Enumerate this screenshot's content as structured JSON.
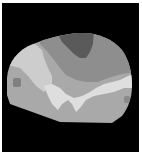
{
  "image": {
    "description": "Grayscale segmented region map of a rounded head/brain-like shape on a black square background",
    "background_color": "#000000",
    "margin_color": "#ffffff",
    "regions": [
      {
        "name": "outer-base",
        "color": "#a9a9a9"
      },
      {
        "name": "upper-band",
        "color": "#8e8e8e"
      },
      {
        "name": "top-dark-patch",
        "color": "#5a5a5a"
      },
      {
        "name": "left-diagonal-band",
        "color": "#cdcdcd"
      },
      {
        "name": "lower-light-band",
        "color": "#dedede"
      },
      {
        "name": "left-small-spot",
        "color": "#808080"
      },
      {
        "name": "right-small-spot",
        "color": "#8a8a8a"
      }
    ]
  }
}
